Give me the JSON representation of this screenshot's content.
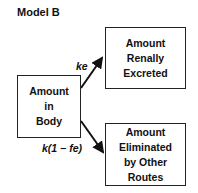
{
  "title": "Model B",
  "boxes": {
    "body": {
      "lines": [
        "Amount",
        "in",
        "Body"
      ]
    },
    "renal": {
      "lines": [
        "Amount",
        "Renally",
        "Excreted"
      ]
    },
    "other": {
      "lines": [
        "Amount",
        "Eliminated",
        "by Other",
        "Routes"
      ]
    }
  },
  "arrows": {
    "to_renal": {
      "label": "ke",
      "from": "Amount in Body",
      "to": "Amount Renally Excreted"
    },
    "to_other": {
      "label": "k(1 − fe)",
      "from": "Amount in Body",
      "to": "Amount Eliminated by Other Routes"
    }
  },
  "colors": {
    "line": "#111111",
    "background": "#ffffff"
  }
}
